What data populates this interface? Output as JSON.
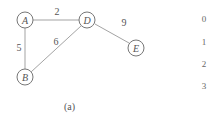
{
  "graph": {
    "nodes": [
      {
        "id": "A",
        "label": "A",
        "x": 25,
        "y": 20
      },
      {
        "id": "D",
        "label": "D",
        "x": 87,
        "y": 20
      },
      {
        "id": "B",
        "label": "B",
        "x": 25,
        "y": 77
      },
      {
        "id": "E",
        "label": "E",
        "x": 136,
        "y": 48
      }
    ],
    "edges": [
      {
        "from": "A",
        "to": "D",
        "weight": "2"
      },
      {
        "from": "A",
        "to": "B",
        "weight": "5"
      },
      {
        "from": "B",
        "to": "D",
        "weight": "6"
      },
      {
        "from": "D",
        "to": "E",
        "weight": "9"
      }
    ]
  },
  "index_column": [
    "0",
    "1",
    "2",
    "3"
  ],
  "caption": "(a)"
}
